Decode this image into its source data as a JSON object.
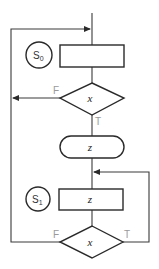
{
  "diagram": {
    "type": "flowchart",
    "colors": {
      "stroke": "#2a2a2a",
      "edge_label": "#9a9a9a",
      "background": "#ffffff"
    },
    "states": [
      {
        "id": "S0",
        "label": "S",
        "subscript": "0"
      },
      {
        "id": "S1",
        "label": "S",
        "subscript": "1"
      }
    ],
    "nodes": {
      "box1": {
        "shape": "rectangle",
        "label": ""
      },
      "decision1": {
        "shape": "diamond",
        "label": "x"
      },
      "terminal": {
        "shape": "stadium",
        "label": "z"
      },
      "box2": {
        "shape": "rectangle",
        "label": "z"
      },
      "decision2": {
        "shape": "diamond",
        "label": "x"
      }
    },
    "edges": {
      "decision1_false": "F",
      "decision1_true": "T",
      "decision2_false": "F",
      "decision2_true": "T"
    }
  }
}
